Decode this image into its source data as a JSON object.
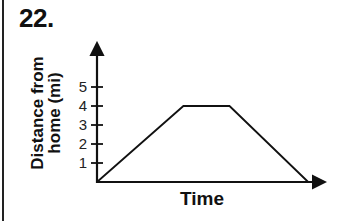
{
  "problem": {
    "number": "22."
  },
  "chart_data": {
    "type": "line",
    "title": "",
    "xlabel": "Time",
    "ylabel": "Distance from home (mi)",
    "ylabel_lines": [
      "Distance from",
      "home (mi)"
    ],
    "yticks": [
      1,
      2,
      3,
      4,
      5
    ],
    "ytick_labels": [
      "1",
      "2",
      "3",
      "4",
      "5"
    ],
    "xticks": [],
    "ylim": [
      0,
      7
    ],
    "grid": false,
    "legend": null,
    "series": [
      {
        "name": "distance",
        "x": [
          0,
          4.5,
          6.9,
          11
        ],
        "y": [
          0,
          4,
          4,
          0
        ],
        "description": "Increase linearly from 0 to 4 mi, stay constant at 4 mi, then decrease linearly back to 0"
      }
    ],
    "segments": [
      {
        "label": "moving away from home",
        "from": 0,
        "to": 4
      },
      {
        "label": "constant distance",
        "from": 4,
        "to": 4
      },
      {
        "label": "returning home",
        "from": 4,
        "to": 0
      }
    ]
  },
  "colors": {
    "ink": "#111111",
    "background": "#ffffff"
  }
}
